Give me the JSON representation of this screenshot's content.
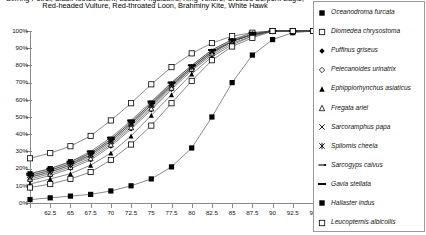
{
  "title": {
    "line1": "Stirring Petrel, Black-footed Stork, Lesser Frigatebird, King Vulture, Crested Serpent Eagle,",
    "line2": "Red-headed Vulture, Red-throated Loon, Brahminy Kite, White Hawk"
  },
  "axes": {
    "y_labels": [
      "100%",
      "90%",
      "80%",
      "70%",
      "60%",
      "50%",
      "40%",
      "30%",
      "20%",
      "10%",
      "0%"
    ],
    "x_labels": [
      "",
      "62.5",
      "65",
      "67.5",
      "70",
      "72.5",
      "75",
      "77.5",
      "80",
      "82.5",
      "85",
      "87.5",
      "90",
      "92.5",
      "95"
    ]
  },
  "legend": {
    "items": [
      {
        "label": "Oceanodroma furcata",
        "marker": "filled-square",
        "icon_name": "marker-filled-square-icon"
      },
      {
        "label": "Diomedea chrysostoma",
        "marker": "open-square",
        "icon_name": "marker-open-square-icon"
      },
      {
        "label": "Puffinus griseus",
        "marker": "filled-diamond",
        "icon_name": "marker-filled-diamond-icon"
      },
      {
        "label": "Pelecanoides urinatrix",
        "marker": "open-diamond",
        "icon_name": "marker-open-diamond-icon"
      },
      {
        "label": "Ephippiorhynchus asiaticus",
        "marker": "filled-triangle",
        "icon_name": "marker-filled-triangle-icon"
      },
      {
        "label": "Fregata ariel",
        "marker": "open-triangle",
        "icon_name": "marker-open-triangle-icon"
      },
      {
        "label": "Sarcoramphus papa",
        "marker": "cross-x",
        "icon_name": "marker-cross-x-icon"
      },
      {
        "label": "Spilornis cheela",
        "marker": "asterisk",
        "icon_name": "marker-asterisk-icon"
      },
      {
        "label": "Sarcogyps calvus",
        "marker": "dash-dot",
        "icon_name": "marker-dash-dot-icon"
      },
      {
        "label": "Gavia stellata",
        "marker": "thick-dash",
        "icon_name": "marker-thick-dash-icon"
      },
      {
        "label": "Haliaster indus",
        "marker": "filled-square",
        "icon_name": "marker-filled-square-icon"
      },
      {
        "label": "Leucopternis albicollis",
        "marker": "open-square",
        "icon_name": "marker-open-square-icon"
      }
    ]
  },
  "chart_data": {
    "type": "line",
    "title": "Stirring Petrel, Black-footed Stork, Lesser Frigatebird, King Vulture, Crested Serpent Eagle, Red-headed Vulture, Red-throated Loon, Brahminy Kite, White Hawk",
    "xlabel": "",
    "ylabel": "",
    "xlim": [
      60,
      95
    ],
    "ylim": [
      0,
      100
    ],
    "x": [
      60,
      62.5,
      65,
      67.5,
      70,
      72.5,
      75,
      77.5,
      80,
      82.5,
      85,
      87.5,
      90,
      92.5,
      95
    ],
    "grid": false,
    "legend_position": "right",
    "y_tick_format": "percent",
    "series": [
      {
        "name": "Oceanodroma furcata",
        "marker": "filled-square",
        "values": [
          17,
          20,
          24,
          29,
          37,
          47,
          58,
          69,
          79,
          88,
          94,
          98,
          100,
          100,
          100
        ]
      },
      {
        "name": "Diomedea chrysostoma",
        "marker": "open-square",
        "values": [
          26,
          29,
          33,
          39,
          48,
          58,
          69,
          79,
          87,
          93,
          97,
          99,
          100,
          100,
          100
        ]
      },
      {
        "name": "Puffinus griseus",
        "marker": "filled-diamond",
        "values": [
          13,
          16,
          20,
          25,
          33,
          43,
          54,
          66,
          77,
          86,
          93,
          97,
          100,
          100,
          100
        ]
      },
      {
        "name": "Pelecanoides urinatrix",
        "marker": "open-diamond",
        "values": [
          15,
          18,
          22,
          27,
          35,
          45,
          56,
          68,
          78,
          87,
          94,
          98,
          100,
          100,
          100
        ]
      },
      {
        "name": "Ephippiorhynchus asiaticus",
        "marker": "filled-triangle",
        "values": [
          11,
          14,
          17,
          22,
          29,
          39,
          51,
          63,
          75,
          85,
          92,
          97,
          100,
          100,
          100
        ]
      },
      {
        "name": "Fregata ariel",
        "marker": "open-triangle",
        "values": [
          14,
          17,
          21,
          26,
          34,
          44,
          55,
          67,
          78,
          87,
          94,
          98,
          100,
          100,
          100
        ]
      },
      {
        "name": "Sarcoramphus papa",
        "marker": "cross-x",
        "values": [
          16,
          19,
          23,
          28,
          36,
          46,
          57,
          68,
          79,
          88,
          94,
          98,
          100,
          100,
          100
        ]
      },
      {
        "name": "Spilornis cheela",
        "marker": "asterisk",
        "values": [
          15,
          18,
          22,
          28,
          36,
          46,
          57,
          69,
          79,
          88,
          94,
          98,
          100,
          100,
          100
        ]
      },
      {
        "name": "Sarcogyps calvus",
        "marker": "dash-dot",
        "values": [
          16,
          19,
          23,
          29,
          37,
          47,
          58,
          70,
          80,
          89,
          95,
          98,
          100,
          100,
          100
        ]
      },
      {
        "name": "Gavia stellata",
        "marker": "thick-dash",
        "values": [
          17,
          20,
          24,
          30,
          38,
          48,
          59,
          70,
          80,
          89,
          95,
          99,
          100,
          100,
          100
        ]
      },
      {
        "name": "Haliaster indus",
        "marker": "filled-square",
        "values": [
          2,
          3,
          4,
          5,
          7,
          10,
          14,
          21,
          32,
          50,
          70,
          86,
          95,
          99,
          100
        ]
      },
      {
        "name": "Leucopternis albicollis",
        "marker": "open-square",
        "values": [
          9,
          11,
          14,
          18,
          25,
          34,
          45,
          58,
          71,
          83,
          91,
          96,
          100,
          100,
          100
        ]
      }
    ]
  }
}
